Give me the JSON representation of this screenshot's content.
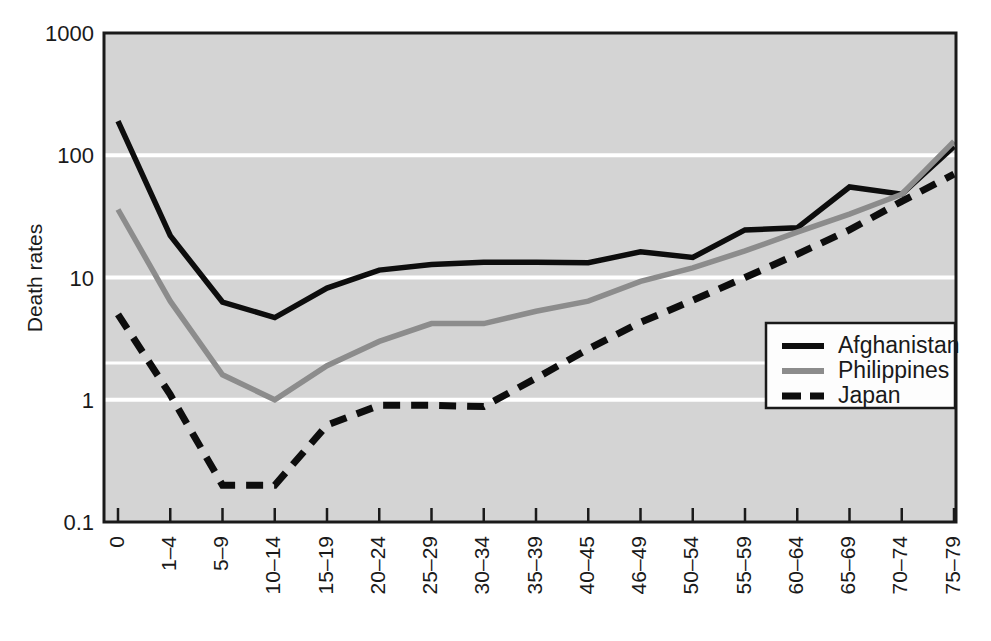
{
  "chart_data": {
    "type": "line",
    "title": "",
    "xlabel": "",
    "ylabel": "Death rates",
    "yscale": "log",
    "ylim": [
      0.1,
      1000
    ],
    "ytick_labels": [
      "1000",
      "100",
      "10",
      "1",
      "0.1"
    ],
    "ytick_values": [
      1000,
      100,
      10,
      1,
      0.1
    ],
    "extra_gridlines": [
      2
    ],
    "grid": true,
    "legend_position": "lower-right inside plot",
    "plot_background": "#d4d4d4",
    "categories": [
      "0",
      "1–4",
      "5–9",
      "10–14",
      "15–19",
      "20–24",
      "25–29",
      "30–34",
      "35–39",
      "40–45",
      "46–49",
      "50–54",
      "55–59",
      "60–64",
      "65–69",
      "70–74",
      "75–79"
    ],
    "series": [
      {
        "name": "Afghanistan",
        "color": "#0d0d0d",
        "style": "solid",
        "values": [
          190,
          22,
          6.3,
          4.7,
          8.2,
          11.5,
          12.8,
          13.3,
          13.3,
          13.2,
          16.2,
          14.6,
          24.5,
          25.5,
          55,
          48,
          118
        ]
      },
      {
        "name": "Philippines",
        "color": "#8c8c8c",
        "style": "solid",
        "values": [
          36,
          6.4,
          1.6,
          1.0,
          1.9,
          3.0,
          4.2,
          4.2,
          5.3,
          6.4,
          9.3,
          12.0,
          16.5,
          23.5,
          33,
          48,
          130
        ]
      },
      {
        "name": "Japan",
        "color": "#0d0d0d",
        "style": "dashed",
        "values": [
          5.0,
          1.1,
          0.2,
          0.2,
          0.62,
          0.9,
          0.9,
          0.88,
          1.5,
          2.6,
          4.3,
          6.5,
          10.0,
          15.5,
          24.5,
          42,
          70
        ]
      }
    ]
  },
  "legend": {
    "entries": [
      {
        "label": "Afghanistan"
      },
      {
        "label": "Philippines"
      },
      {
        "label": "Japan"
      }
    ]
  },
  "axes": {
    "y_title": "Death rates"
  }
}
